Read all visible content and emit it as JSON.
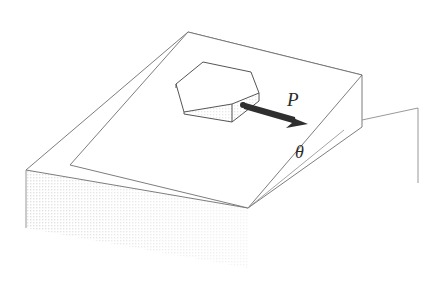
{
  "figure": {
    "background_color": "#ffffff",
    "line_color": "#6e6e6e",
    "dark_line_color": "#3a3a3a",
    "shade_color": "#efefef",
    "shade_color_light": "#f4f4f4",
    "text_color": "#2b2b2b"
  },
  "labels": {
    "force": "P",
    "angle": "θ"
  },
  "annotations": {
    "force_description": "applied force P acting on the hexagonal block, pointing down-right along the incline surface",
    "angle_description": "incline angle theta between the sloping face and the horizontal base"
  },
  "geometry": {
    "base_block": {
      "name": "rectangular base slab",
      "top_face": "26,170 188,32 362,75 248,208",
      "front_left_edge": "26,170 26,228",
      "front_face_shaded": true
    },
    "incline_wedge": {
      "name": "inclined ramp wedge",
      "top_sloped_face": "70,165 188,32 362,75 248,208",
      "apex_top_left": "188,32",
      "apex_top_right": "362,75",
      "front_vertex": "248,208",
      "inner_ledge_corner": "70,165",
      "right_vertical_edge": "362,75 362,127",
      "slope_bottom_edge": "248,208 362,127"
    },
    "hex_block": {
      "name": "hexagonal block resting on incline",
      "top_face": "176,84 202,62 250,72 258,100 232,122 184,112",
      "front_shaded_face": "176,84 184,112 232,122 232,104 258,100 258,93",
      "shaded": true
    },
    "force_arrow": {
      "tail": "243,105",
      "head": "307,123",
      "style": "solid tapered arrow"
    },
    "angle_lines": {
      "horizontal_ray": "248,208 362,127",
      "slope_ray": "248,208 340,133"
    },
    "reference_wall": {
      "name": "background reference wall line",
      "path": "362,120 417,108 417,182"
    }
  }
}
